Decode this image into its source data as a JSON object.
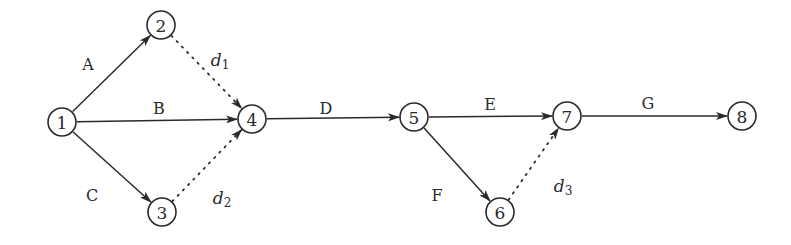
{
  "diagram": {
    "type": "activity-on-arrow network",
    "background": "#ffffff",
    "stroke_color": "#2a2a2a",
    "nodes": [
      {
        "id": "1",
        "label": "1",
        "x": 62,
        "y": 122
      },
      {
        "id": "2",
        "label": "2",
        "x": 161,
        "y": 25
      },
      {
        "id": "3",
        "label": "3",
        "x": 162,
        "y": 212
      },
      {
        "id": "4",
        "label": "4",
        "x": 252,
        "y": 119
      },
      {
        "id": "5",
        "label": "5",
        "x": 414,
        "y": 117
      },
      {
        "id": "6",
        "label": "6",
        "x": 500,
        "y": 212
      },
      {
        "id": "7",
        "label": "7",
        "x": 567,
        "y": 116
      },
      {
        "id": "8",
        "label": "8",
        "x": 742,
        "y": 116
      }
    ],
    "edges": [
      {
        "from": "1",
        "to": "2",
        "label": "A",
        "style": "solid",
        "lx": 88,
        "ly": 64
      },
      {
        "from": "1",
        "to": "4",
        "label": "B",
        "style": "solid",
        "lx": 159,
        "ly": 108
      },
      {
        "from": "1",
        "to": "3",
        "label": "C",
        "style": "solid",
        "lx": 92,
        "ly": 195
      },
      {
        "from": "2",
        "to": "4",
        "label": "d",
        "subscript": "1",
        "style": "dotted",
        "lx": 220,
        "ly": 60
      },
      {
        "from": "3",
        "to": "4",
        "label": "d",
        "subscript": "2",
        "style": "dotted",
        "lx": 222,
        "ly": 198
      },
      {
        "from": "4",
        "to": "5",
        "label": "D",
        "style": "solid",
        "lx": 326,
        "ly": 108
      },
      {
        "from": "5",
        "to": "7",
        "label": "E",
        "style": "solid",
        "lx": 490,
        "ly": 104
      },
      {
        "from": "5",
        "to": "6",
        "label": "F",
        "style": "solid",
        "lx": 437,
        "ly": 195
      },
      {
        "from": "6",
        "to": "7",
        "label": "d",
        "subscript": "3",
        "style": "dotted",
        "lx": 563,
        "ly": 186
      },
      {
        "from": "7",
        "to": "8",
        "label": "G",
        "style": "solid",
        "lx": 648,
        "ly": 103
      }
    ]
  }
}
